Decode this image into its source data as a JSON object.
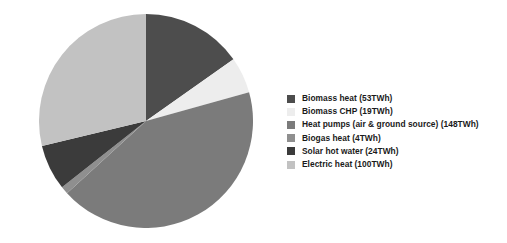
{
  "chart_data": {
    "type": "pie",
    "title": "",
    "subtitle": "",
    "unit": "TWh",
    "total": 348,
    "legend_position": "right",
    "start_angle_deg": 0,
    "direction": "clockwise",
    "categories": [
      "Biomass heat",
      "Biomass CHP",
      "Heat pumps (air & ground source)",
      "Biogas heat",
      "Solar hot water",
      "Electric heat"
    ],
    "values": [
      53,
      19,
      148,
      4,
      24,
      100
    ],
    "colors": [
      "#4d4d4d",
      "#ededed",
      "#7b7b7b",
      "#8f8f8f",
      "#3b3b3b",
      "#c2c2c2"
    ],
    "slices": [
      {
        "label": "Biomass heat",
        "value": 53,
        "unit": "TWh",
        "color": "#4d4d4d",
        "percent": 15.2
      },
      {
        "label": "Biomass CHP",
        "value": 19,
        "unit": "TWh",
        "color": "#ededed",
        "percent": 5.5
      },
      {
        "label": "Heat pumps (air & ground source)",
        "value": 148,
        "unit": "TWh",
        "color": "#7b7b7b",
        "percent": 42.5
      },
      {
        "label": "Biogas heat",
        "value": 4,
        "unit": "TWh",
        "color": "#8f8f8f",
        "percent": 1.1
      },
      {
        "label": "Solar hot water",
        "value": 24,
        "unit": "TWh",
        "color": "#3b3b3b",
        "percent": 6.9
      },
      {
        "label": "Electric heat",
        "value": 100,
        "unit": "TWh",
        "color": "#c2c2c2",
        "percent": 28.7
      }
    ]
  },
  "legend": {
    "items": [
      {
        "label": "Biomass heat (53TWh)",
        "color": "#4d4d4d"
      },
      {
        "label": "Biomass CHP (19TWh)",
        "color": "#ededed"
      },
      {
        "label": "Heat pumps (air & ground source) (148TWh)",
        "color": "#7b7b7b"
      },
      {
        "label": "Biogas heat (4TWh)",
        "color": "#8f8f8f"
      },
      {
        "label": "Solar hot water (24TWh)",
        "color": "#3b3b3b"
      },
      {
        "label": "Electric heat (100TWh)",
        "color": "#c2c2c2"
      }
    ]
  }
}
